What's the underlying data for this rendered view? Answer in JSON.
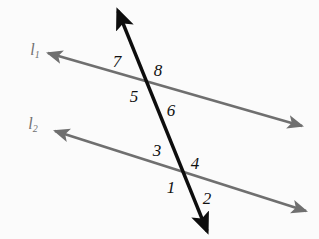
{
  "figure": {
    "background_color": "#fbfbfb",
    "parallel_line_color": "#6f6f6f",
    "transversal_color": "#0d0d0d",
    "label_color": "#101010",
    "line_label_color": "#707070"
  },
  "lines": [
    {
      "name": "line-l1",
      "label": "l",
      "subscript": "1",
      "label_x": 35,
      "label_y": 50,
      "x1": 48,
      "y1": 53,
      "x2": 302,
      "y2": 126,
      "color": "#6f6f6f",
      "arrow_start": true,
      "arrow_end": true
    },
    {
      "name": "line-l2",
      "label": "l",
      "subscript": "2",
      "label_x": 33,
      "label_y": 124,
      "x1": 55,
      "y1": 131,
      "x2": 306,
      "y2": 211,
      "color": "#6f6f6f",
      "arrow_start": true,
      "arrow_end": true
    },
    {
      "name": "transversal",
      "label": "",
      "subscript": "",
      "label_x": 0,
      "label_y": 0,
      "x1": 118,
      "y1": 11,
      "x2": 207,
      "y2": 231,
      "color": "#0d0d0d",
      "arrow_start": true,
      "arrow_end": true
    }
  ],
  "intersections": [
    {
      "name": "intersection-l1",
      "x": 148,
      "y": 84
    },
    {
      "name": "intersection-l2",
      "x": 184,
      "y": 176
    }
  ],
  "angle_labels": [
    {
      "id": "angle-7",
      "text": "7",
      "x": 117,
      "y": 61
    },
    {
      "id": "angle-8",
      "text": "8",
      "x": 158,
      "y": 70
    },
    {
      "id": "angle-5",
      "text": "5",
      "x": 134,
      "y": 96
    },
    {
      "id": "angle-6",
      "text": "6",
      "x": 171,
      "y": 110
    },
    {
      "id": "angle-3",
      "text": "3",
      "x": 157,
      "y": 150
    },
    {
      "id": "angle-4",
      "text": "4",
      "x": 195,
      "y": 163
    },
    {
      "id": "angle-1",
      "text": "1",
      "x": 171,
      "y": 187
    },
    {
      "id": "angle-2",
      "text": "2",
      "x": 207,
      "y": 198
    }
  ]
}
